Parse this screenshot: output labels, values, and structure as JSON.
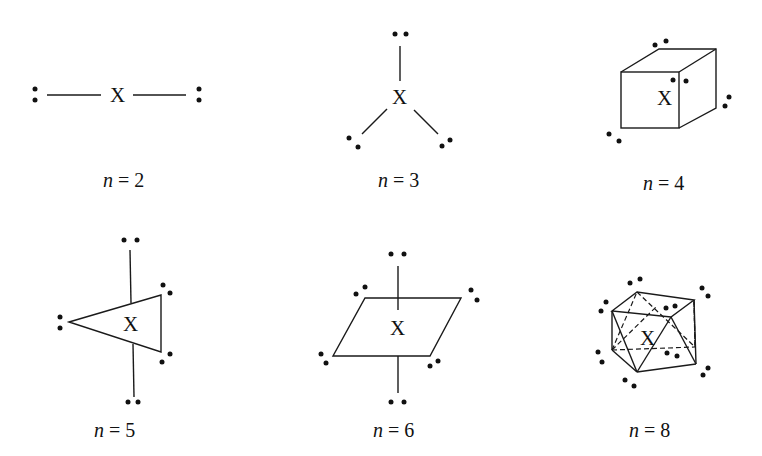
{
  "diagram": {
    "central_atom": "X",
    "panels": [
      {
        "n": "2",
        "label_var": "n",
        "label_eq": " = 2",
        "geometry": "linear"
      },
      {
        "n": "3",
        "label_var": "n",
        "label_eq": " = 3",
        "geometry": "trigonal planar"
      },
      {
        "n": "4",
        "label_var": "n",
        "label_eq": " = 4",
        "geometry": "tetrahedral (cube)"
      },
      {
        "n": "5",
        "label_var": "n",
        "label_eq": " = 5",
        "geometry": "trigonal bipyramidal"
      },
      {
        "n": "6",
        "label_var": "n",
        "label_eq": " = 6",
        "geometry": "octahedral"
      },
      {
        "n": "8",
        "label_var": "n",
        "label_eq": " = 8",
        "geometry": "square antiprism"
      }
    ]
  }
}
